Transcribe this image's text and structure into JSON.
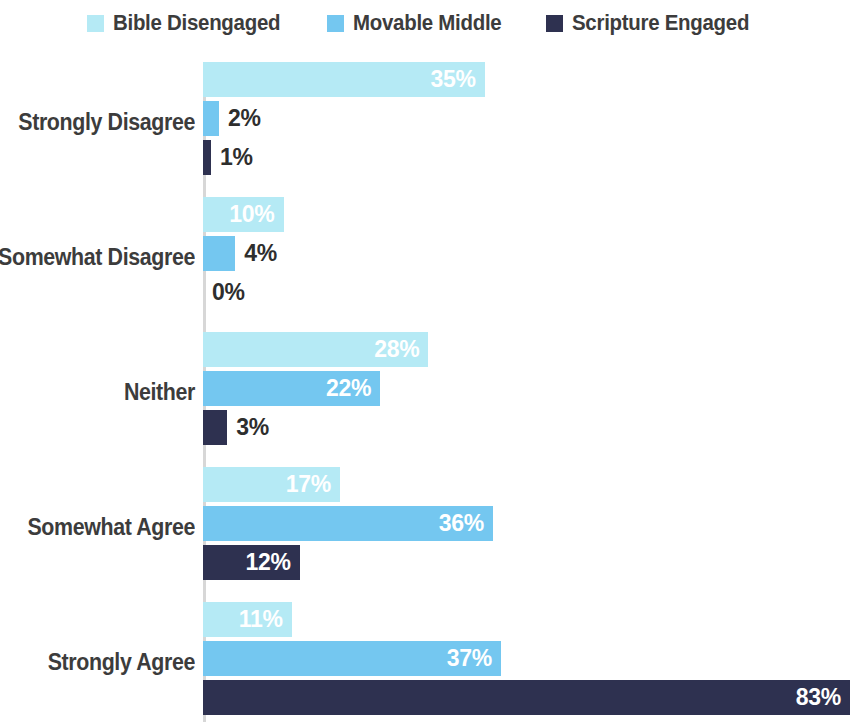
{
  "legend": {
    "items": [
      {
        "label": "Bible Disengaged",
        "color": "#b5eaf5",
        "key": "bible_disengaged"
      },
      {
        "label": "Movable Middle",
        "color": "#74c7f0",
        "key": "movable_middle"
      },
      {
        "label": "Scripture Engaged",
        "color": "#2e3150",
        "key": "scripture_engaged"
      }
    ]
  },
  "chart_data": {
    "type": "bar",
    "orientation": "horizontal",
    "title": "",
    "subtitle": "",
    "xlabel": "",
    "ylabel": "",
    "xlim": [
      0,
      83
    ],
    "grid": false,
    "legend_position": "top-center",
    "categories": [
      "Strongly Disagree",
      "Somewhat Disagree",
      "Neither",
      "Somewhat Agree",
      "Strongly Agree"
    ],
    "series": [
      {
        "name": "Bible Disengaged",
        "color": "#b5eaf5",
        "values": [
          35,
          10,
          28,
          17,
          11
        ],
        "labels": [
          "35%",
          "10%",
          "28%",
          "17%",
          "11%"
        ]
      },
      {
        "name": "Movable Middle",
        "color": "#74c7f0",
        "values": [
          2,
          4,
          22,
          36,
          37
        ],
        "labels": [
          "2%",
          "4%",
          "22%",
          "36%",
          "37%"
        ]
      },
      {
        "name": "Scripture Engaged",
        "color": "#2e3150",
        "values": [
          1,
          0,
          3,
          12,
          83
        ],
        "labels": [
          "1%",
          "0%",
          "3%",
          "12%",
          "83%"
        ]
      }
    ]
  }
}
